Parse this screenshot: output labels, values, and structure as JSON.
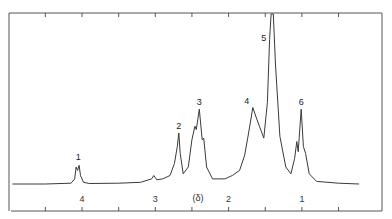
{
  "chart_data": {
    "type": "line",
    "title": "",
    "xlabel": "(δ)",
    "ylabel": "",
    "xlim": [
      4.95,
      0.22
    ],
    "x_reversed": true,
    "grid": false,
    "legend": null,
    "tick_labels": [
      "4",
      "3",
      "2",
      "1"
    ],
    "tick_values": [
      4,
      3,
      2,
      1
    ],
    "minor_ticks": [
      4.5,
      4.0,
      3.5,
      3.0,
      2.5,
      2.0,
      1.5,
      1.0,
      0.5
    ],
    "peaks": [
      {
        "label": "1",
        "delta": 4.05,
        "relative_height": 0.12
      },
      {
        "label": "2",
        "delta": 2.68,
        "relative_height": 0.3
      },
      {
        "label": "3",
        "delta": 2.4,
        "relative_height": 0.44
      },
      {
        "label": "4",
        "delta": 1.67,
        "relative_height": 0.45
      },
      {
        "label": "5",
        "delta": 1.41,
        "relative_height": 1.0
      },
      {
        "label": "6",
        "delta": 1.01,
        "relative_height": 0.44
      }
    ],
    "series": [
      {
        "name": "spectrum",
        "points": [
          [
            4.95,
            0.0
          ],
          [
            4.5,
            0.0
          ],
          [
            4.15,
            0.005
          ],
          [
            4.1,
            0.03
          ],
          [
            4.08,
            0.1
          ],
          [
            4.06,
            0.08
          ],
          [
            4.04,
            0.11
          ],
          [
            4.02,
            0.05
          ],
          [
            3.98,
            0.01
          ],
          [
            3.9,
            0.003
          ],
          [
            3.5,
            0.005
          ],
          [
            3.2,
            0.01
          ],
          [
            3.05,
            0.03
          ],
          [
            3.02,
            0.05
          ],
          [
            2.98,
            0.025
          ],
          [
            2.9,
            0.03
          ],
          [
            2.8,
            0.05
          ],
          [
            2.74,
            0.12
          ],
          [
            2.7,
            0.22
          ],
          [
            2.68,
            0.3
          ],
          [
            2.66,
            0.18
          ],
          [
            2.62,
            0.06
          ],
          [
            2.55,
            0.1
          ],
          [
            2.5,
            0.26
          ],
          [
            2.46,
            0.34
          ],
          [
            2.44,
            0.32
          ],
          [
            2.4,
            0.44
          ],
          [
            2.36,
            0.26
          ],
          [
            2.34,
            0.27
          ],
          [
            2.3,
            0.1
          ],
          [
            2.22,
            0.03
          ],
          [
            2.05,
            0.03
          ],
          [
            1.95,
            0.05
          ],
          [
            1.85,
            0.08
          ],
          [
            1.78,
            0.17
          ],
          [
            1.74,
            0.27
          ],
          [
            1.7,
            0.37
          ],
          [
            1.67,
            0.45
          ],
          [
            1.63,
            0.4
          ],
          [
            1.58,
            0.34
          ],
          [
            1.52,
            0.27
          ],
          [
            1.47,
            0.48
          ],
          [
            1.44,
            0.85
          ],
          [
            1.42,
            1.0
          ],
          [
            1.39,
            1.0
          ],
          [
            1.36,
            0.7
          ],
          [
            1.3,
            0.28
          ],
          [
            1.22,
            0.1
          ],
          [
            1.15,
            0.06
          ],
          [
            1.1,
            0.15
          ],
          [
            1.07,
            0.25
          ],
          [
            1.05,
            0.19
          ],
          [
            1.01,
            0.44
          ],
          [
            0.98,
            0.22
          ],
          [
            0.95,
            0.18
          ],
          [
            0.9,
            0.06
          ],
          [
            0.8,
            0.015
          ],
          [
            0.5,
            0.005
          ],
          [
            0.22,
            0.0
          ]
        ]
      }
    ]
  },
  "labels": {
    "axis_unit": "(δ)",
    "ticks": [
      "4",
      "3",
      "2",
      "1"
    ],
    "peaks": [
      "1",
      "2",
      "3",
      "4",
      "5",
      "6"
    ]
  }
}
